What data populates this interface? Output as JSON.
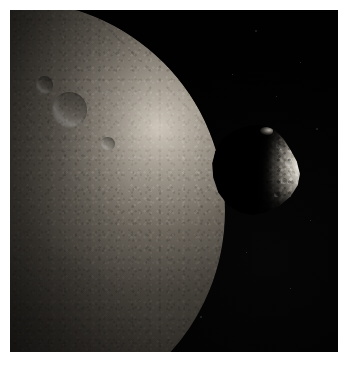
{
  "image": {
    "kind": "astronomical-photograph",
    "subject": "planetary-body-with-moon",
    "border_color": "#ffffff",
    "sky_color": "#000000",
    "frame": {
      "x": 10,
      "y": 10,
      "width": 328,
      "height": 342
    },
    "caption": ""
  },
  "primary_body": {
    "name": "large-cratered-body",
    "description": "Large heavily cratered body filling the left of the frame, lit from the upper right so only a broad crescent limb is illuminated.",
    "highlight_color": "#d8d0c4",
    "midtone_color": "#837c71",
    "shadow_color": "#0a0a09",
    "limb_side": "right",
    "phase": "gibbous-crescent",
    "craters": [
      {
        "name": "crater-upper-right",
        "cx": 63,
        "cy": 26,
        "d": 8.5
      },
      {
        "name": "crater-upper-right-small",
        "cx": 57,
        "cy": 20,
        "d": 4.2
      },
      {
        "name": "crater-mid-left",
        "cx": 27,
        "cy": 34,
        "d": 6.0
      },
      {
        "name": "crater-mid-left-small",
        "cx": 22,
        "cy": 30,
        "d": 3.4
      },
      {
        "name": "crater-center",
        "cx": 35,
        "cy": 48,
        "d": 5.6
      },
      {
        "name": "crater-center-right",
        "cx": 47,
        "cy": 45,
        "d": 3.2
      },
      {
        "name": "crater-lower-center",
        "cx": 42,
        "cy": 60,
        "d": 6.4
      },
      {
        "name": "crater-lower-center-inner",
        "cx": 42,
        "cy": 60,
        "d": 3.0
      },
      {
        "name": "crater-lower-left",
        "cx": 22,
        "cy": 66,
        "d": 3.6
      },
      {
        "name": "crater-bottom-dark-patch",
        "cx": 31,
        "cy": 80,
        "d": 4.4
      },
      {
        "name": "crater-bottom-small",
        "cx": 36,
        "cy": 82,
        "d": 2.6
      },
      {
        "name": "crater-upper-far-left",
        "cx": 14,
        "cy": 24,
        "d": 3.0
      },
      {
        "name": "crater-limb-upper",
        "cx": 72,
        "cy": 34,
        "d": 3.4
      }
    ]
  },
  "secondary_body": {
    "name": "small-irregular-moon",
    "description": "Small irregular potato-shaped moon in front of and to the right of the large body; its left half is in shadow and its right flank is brightly sunlit.",
    "highlight_color": "#e2ddd3",
    "shadow_color": "#040404",
    "lit_side": "right",
    "bounds": {
      "x": 193,
      "y": 113,
      "width": 102,
      "height": 94
    },
    "surface_features": [
      {
        "name": "bright-patch-upper",
        "cx": 76,
        "cy": 24,
        "d": 9
      },
      {
        "name": "crater-lit-mid",
        "cx": 84,
        "cy": 42,
        "d": 7
      },
      {
        "name": "crater-lit-lower",
        "cx": 79,
        "cy": 62,
        "d": 6
      },
      {
        "name": "crater-lit-small",
        "cx": 88,
        "cy": 53,
        "d": 4
      },
      {
        "name": "ridge-shadow-lower",
        "cx": 72,
        "cy": 76,
        "d": 5
      }
    ]
  },
  "starfield": [
    {
      "x": 255,
      "y": 30
    },
    {
      "x": 300,
      "y": 62
    },
    {
      "x": 276,
      "y": 96
    },
    {
      "x": 316,
      "y": 128
    },
    {
      "x": 246,
      "y": 252
    },
    {
      "x": 290,
      "y": 288
    },
    {
      "x": 200,
      "y": 316
    },
    {
      "x": 310,
      "y": 220
    },
    {
      "x": 58,
      "y": 122
    },
    {
      "x": 38,
      "y": 300
    },
    {
      "x": 120,
      "y": 332
    },
    {
      "x": 232,
      "y": 74
    }
  ]
}
